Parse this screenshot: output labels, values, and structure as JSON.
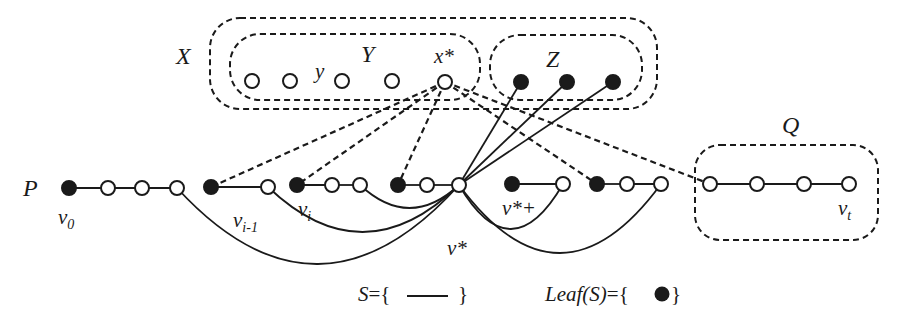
{
  "labels": {
    "X": "X",
    "Y": "Y",
    "y": "y",
    "x_star": "x*",
    "Z": "Z",
    "Q": "Q",
    "P": "P",
    "v0": "v",
    "v0_sub": "0",
    "vi_minus_1": "v",
    "vi_minus_1_sub": "i-1",
    "vi": "v",
    "vi_sub": "i",
    "v_star": "v*",
    "v_star_plus": "v*+",
    "vt": "v",
    "vt_sub": "t"
  },
  "legend": {
    "S_prefix": "S={",
    "S_suffix": "}",
    "leaf_prefix": "Leaf(S)={",
    "leaf_suffix": "}"
  },
  "colors": {
    "ink": "#1a1a1a",
    "background": "#ffffff"
  },
  "sets": {
    "X": {
      "x": 210,
      "y": 18,
      "w": 447,
      "h": 91,
      "r": 30
    },
    "Y": {
      "x": 230,
      "y": 34,
      "w": 250,
      "h": 66,
      "r": 30
    },
    "Z": {
      "x": 490,
      "y": 35,
      "w": 152,
      "h": 65,
      "r": 30
    },
    "Q": {
      "x": 695,
      "y": 145,
      "w": 183,
      "h": 95,
      "r": 25
    }
  },
  "top_nodes": [
    {
      "id": "y1",
      "x": 252,
      "y": 81,
      "filled": false
    },
    {
      "id": "y2",
      "x": 290,
      "y": 81,
      "filled": false
    },
    {
      "id": "y3",
      "x": 342,
      "y": 81,
      "filled": false
    },
    {
      "id": "y4",
      "x": 392,
      "y": 81,
      "filled": false
    },
    {
      "id": "xstar",
      "x": 445,
      "y": 82,
      "filled": false
    },
    {
      "id": "z1",
      "x": 521,
      "y": 82,
      "filled": true
    },
    {
      "id": "z2",
      "x": 567,
      "y": 82,
      "filled": true
    },
    {
      "id": "z3",
      "x": 613,
      "y": 82,
      "filled": true
    }
  ],
  "path_nodes": [
    {
      "id": "p0",
      "x": 69,
      "y": 188,
      "filled": true
    },
    {
      "id": "p1",
      "x": 108,
      "y": 188,
      "filled": false
    },
    {
      "id": "p2",
      "x": 142,
      "y": 188,
      "filled": false
    },
    {
      "id": "p3",
      "x": 177,
      "y": 188,
      "filled": false
    },
    {
      "id": "p4",
      "x": 211,
      "y": 187,
      "filled": true
    },
    {
      "id": "p5",
      "x": 268,
      "y": 187,
      "filled": false
    },
    {
      "id": "p6",
      "x": 297,
      "y": 185,
      "filled": true
    },
    {
      "id": "p7",
      "x": 332,
      "y": 185,
      "filled": false
    },
    {
      "id": "p8",
      "x": 360,
      "y": 185,
      "filled": false
    },
    {
      "id": "p9",
      "x": 398,
      "y": 185,
      "filled": true
    },
    {
      "id": "p10",
      "x": 427,
      "y": 185,
      "filled": false
    },
    {
      "id": "vstar",
      "x": 459,
      "y": 185,
      "filled": false
    },
    {
      "id": "p12",
      "x": 512,
      "y": 184,
      "filled": true
    },
    {
      "id": "p13",
      "x": 563,
      "y": 184,
      "filled": false
    },
    {
      "id": "p14",
      "x": 597,
      "y": 184,
      "filled": true
    },
    {
      "id": "p15",
      "x": 627,
      "y": 184,
      "filled": false
    },
    {
      "id": "p16",
      "x": 661,
      "y": 184,
      "filled": false
    },
    {
      "id": "q1",
      "x": 710,
      "y": 184,
      "filled": false
    },
    {
      "id": "q2",
      "x": 757,
      "y": 184,
      "filled": false
    },
    {
      "id": "q3",
      "x": 804,
      "y": 184,
      "filled": false
    },
    {
      "id": "q4",
      "x": 849,
      "y": 184,
      "filled": false
    }
  ],
  "solid_segments": [
    [
      "p0",
      "p1"
    ],
    [
      "p1",
      "p2"
    ],
    [
      "p2",
      "p3"
    ],
    [
      "p4",
      "p5"
    ],
    [
      "p6",
      "p7"
    ],
    [
      "p7",
      "p8"
    ],
    [
      "p9",
      "p10"
    ],
    [
      "p10",
      "vstar"
    ],
    [
      "p12",
      "p13"
    ],
    [
      "p14",
      "p15"
    ],
    [
      "p15",
      "p16"
    ],
    [
      "q1",
      "q2"
    ],
    [
      "q2",
      "q3"
    ],
    [
      "q3",
      "q4"
    ],
    [
      "vstar",
      "z1"
    ],
    [
      "vstar",
      "z2"
    ],
    [
      "vstar",
      "z3"
    ]
  ],
  "curves": [
    {
      "from": "vstar",
      "to": "p8",
      "dip": 208
    },
    {
      "from": "vstar",
      "to": "p5",
      "dip": 232
    },
    {
      "from": "vstar",
      "to": "p3",
      "dip": 264
    },
    {
      "from": "vstar",
      "to": "p13",
      "dip": 229
    },
    {
      "from": "vstar",
      "to": "p16",
      "dip": 253
    }
  ],
  "dashed_segments": [
    [
      "xstar",
      "p4"
    ],
    [
      "xstar",
      "p6"
    ],
    [
      "xstar",
      "p9"
    ],
    [
      "xstar",
      "p14"
    ],
    [
      "xstar",
      "q1"
    ]
  ]
}
